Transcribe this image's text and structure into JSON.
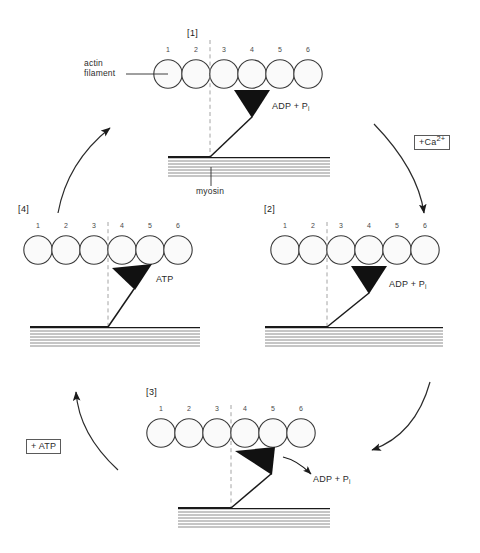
{
  "figure": {
    "actin_unit_numbers": [
      "1",
      "2",
      "3",
      "4",
      "5",
      "6"
    ],
    "labels": {
      "actin_filament_line1": "actin",
      "actin_filament_line2": "filament",
      "myosin": "myosin"
    },
    "colors": {
      "stroke": "#1a1a1a",
      "circle_fill": "#fafafa",
      "circle_stroke": "#3a3a3a",
      "head_fill": "#111111",
      "dash_line": "#9a9a9a",
      "text": "#2b2b2b",
      "box_border": "#5a5a5a",
      "background": "#ffffff"
    }
  },
  "panels": [
    {
      "id": "panel-1",
      "label": "[1]",
      "label_number": "1",
      "chem_label": "ADP + P",
      "chem_subscript": "i",
      "head_state": "attached-vertical",
      "aligned_unit": "3"
    },
    {
      "id": "panel-2",
      "label": "[2]",
      "label_number": "2",
      "chem_label": "ADP + P",
      "chem_subscript": "i",
      "head_state": "attached-vertical",
      "aligned_unit": "3"
    },
    {
      "id": "panel-3",
      "label": "[3]",
      "label_number": "3",
      "chem_label": "ADP + P",
      "chem_subscript": "i",
      "head_state": "power-stroke-released",
      "aligned_unit": "4"
    },
    {
      "id": "panel-4",
      "label": "[4]",
      "label_number": "4",
      "chem_label": "ATP",
      "chem_subscript": "",
      "head_state": "detached-tilted",
      "aligned_unit": "4"
    }
  ],
  "cycle_arrows": [
    {
      "name": "arrow-1-to-2",
      "annotation": "+Ca",
      "annotation_sup": "2+",
      "annotation_boxed": true,
      "direction": "clockwise-right-down"
    },
    {
      "name": "arrow-2-to-3",
      "annotation": "",
      "annotation_sup": "",
      "annotation_boxed": false,
      "direction": "clockwise-down-left"
    },
    {
      "name": "arrow-3-to-4",
      "annotation": "+ ATP",
      "annotation_sup": "",
      "annotation_boxed": true,
      "direction": "clockwise-left-up"
    },
    {
      "name": "arrow-4-to-1",
      "annotation": "",
      "annotation_sup": "",
      "annotation_boxed": false,
      "direction": "clockwise-up-right"
    }
  ]
}
